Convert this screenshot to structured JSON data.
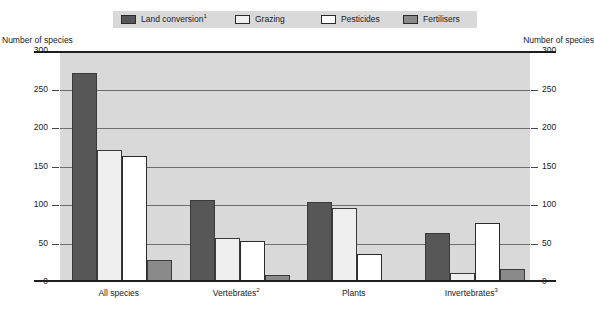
{
  "legend": {
    "items": [
      {
        "label": "Land conversion",
        "sup": "1",
        "color": "#575757",
        "icon": "legend-swatch-icon"
      },
      {
        "label": "Grazing",
        "sup": "",
        "color": "#efefef",
        "icon": "legend-swatch-icon"
      },
      {
        "label": "Pesticides",
        "sup": "",
        "color": "#ffffff",
        "icon": "legend-swatch-icon"
      },
      {
        "label": "Fertilisers",
        "sup": "",
        "color": "#8a8a8a",
        "icon": "legend-swatch-icon"
      }
    ]
  },
  "axis": {
    "left_title": "Number of species",
    "right_title": "Number of species"
  },
  "chart_data": {
    "type": "bar",
    "title": "",
    "xlabel": "",
    "ylabel": "Number of species",
    "ylim": [
      0,
      300
    ],
    "yticks": [
      0,
      50,
      100,
      150,
      200,
      250,
      300
    ],
    "ytick_labels": [
      "0",
      "50",
      "100",
      "150",
      "200",
      "250",
      "300"
    ],
    "grid": true,
    "legend_position": "top",
    "categories": [
      "All species",
      "Vertebrates",
      "Plants",
      "Invertebrates"
    ],
    "category_sups": [
      "",
      "2",
      "",
      "3"
    ],
    "series": [
      {
        "name": "Land conversion",
        "color": "#575757",
        "values": [
          272,
          106,
          104,
          64
        ]
      },
      {
        "name": "Grazing",
        "color": "#efefef",
        "values": [
          171,
          57,
          96,
          12
        ]
      },
      {
        "name": "Pesticides",
        "color": "#ffffff",
        "values": [
          164,
          53,
          36,
          77
        ]
      },
      {
        "name": "Fertilisers",
        "color": "#8a8a8a",
        "values": [
          28,
          9,
          2,
          17
        ]
      }
    ]
  }
}
